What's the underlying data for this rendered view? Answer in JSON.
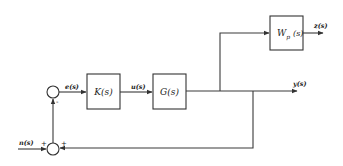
{
  "diagram": {
    "type": "block-diagram",
    "blocks": [
      {
        "id": "K",
        "label": "K(s)"
      },
      {
        "id": "G",
        "label": "G(s)"
      },
      {
        "id": "Wp",
        "label_main": "W",
        "label_sub": "p",
        "label_arg": "(s)"
      }
    ],
    "signals": {
      "error": "e(s)",
      "control": "u(s)",
      "output": "y(s)",
      "performance": "z(s)",
      "noise": "n(s)"
    },
    "summing_junctions": [
      {
        "id": "error-sum",
        "signs": [
          "-"
        ]
      },
      {
        "id": "noise-sum",
        "signs": [
          "+",
          "+"
        ]
      }
    ]
  }
}
